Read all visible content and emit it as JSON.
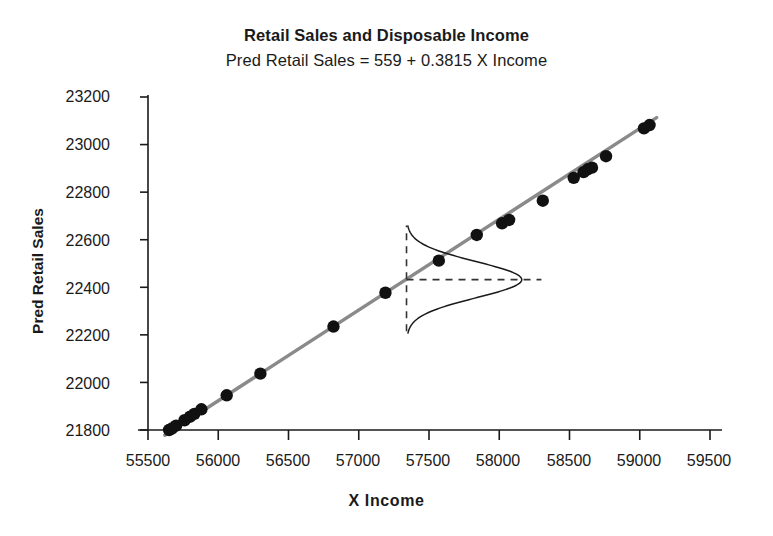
{
  "chart_data": {
    "type": "scatter",
    "title": "Retail Sales and Disposable Income",
    "subtitle": "Pred Retail Sales = 559 + 0.3815 X  Income",
    "xlabel": "X  Income",
    "ylabel": "Pred Retail Sales",
    "xlim": [
      55340,
      59660
    ],
    "ylim": [
      21760,
      23260
    ],
    "xticks": [
      55500,
      56000,
      56500,
      57000,
      57500,
      58000,
      58500,
      59000,
      59500
    ],
    "yticks": [
      21800,
      22000,
      22200,
      22400,
      22600,
      22800,
      23000,
      23200
    ],
    "xtick_labels": [
      "55500",
      "56000",
      "56500",
      "57000",
      "57500",
      "58000",
      "58500",
      "59000",
      "59500"
    ],
    "ytick_labels": [
      "21800",
      "22000",
      "22200",
      "22400",
      "22600",
      "22800",
      "23000",
      "23200"
    ],
    "grid": false,
    "legend": "none",
    "series": [
      {
        "name": "Observed fitted values",
        "marker": "filled-circle",
        "color": "#111111",
        "points": [
          {
            "x": 55650,
            "y": 21800
          },
          {
            "x": 55670,
            "y": 21806
          },
          {
            "x": 55700,
            "y": 21818
          },
          {
            "x": 55760,
            "y": 21841
          },
          {
            "x": 55800,
            "y": 21856
          },
          {
            "x": 55830,
            "y": 21868
          },
          {
            "x": 55880,
            "y": 21887
          },
          {
            "x": 56060,
            "y": 21946
          },
          {
            "x": 56300,
            "y": 22037
          },
          {
            "x": 56820,
            "y": 22235
          },
          {
            "x": 57190,
            "y": 22377
          },
          {
            "x": 57570,
            "y": 22512
          },
          {
            "x": 57840,
            "y": 22620
          },
          {
            "x": 58020,
            "y": 22669
          },
          {
            "x": 58070,
            "y": 22683
          },
          {
            "x": 58310,
            "y": 22764
          },
          {
            "x": 58530,
            "y": 22860
          },
          {
            "x": 58600,
            "y": 22884
          },
          {
            "x": 58630,
            "y": 22896
          },
          {
            "x": 58660,
            "y": 22903
          },
          {
            "x": 58760,
            "y": 22951
          },
          {
            "x": 59030,
            "y": 23068
          },
          {
            "x": 59070,
            "y": 23082
          }
        ]
      }
    ],
    "regression_line": {
      "name": "Fitted regression line",
      "color": "#8a8a8a",
      "intercept": 559,
      "slope": 0.3815,
      "x_start": 55620,
      "x_end": 59120
    },
    "annotations": {
      "vertical_reference": {
        "name": "vertical dashed reference line",
        "x": 57340,
        "y_bottom": 22215,
        "y_top": 22660,
        "style": "dashed"
      },
      "horizontal_reference": {
        "name": "horizontal dashed reference line",
        "y": 22432,
        "x_start": 57340,
        "x_end": 58300,
        "style": "dashed"
      },
      "normal_curve": {
        "name": "conditional normal distribution of Y given X",
        "mean": 22432,
        "baseline_x": 57340,
        "peak_x": 58160,
        "y_low": 22205,
        "y_high": 22660,
        "orientation": "horizontal-peak-right",
        "color": "#1a1a1a"
      }
    }
  }
}
